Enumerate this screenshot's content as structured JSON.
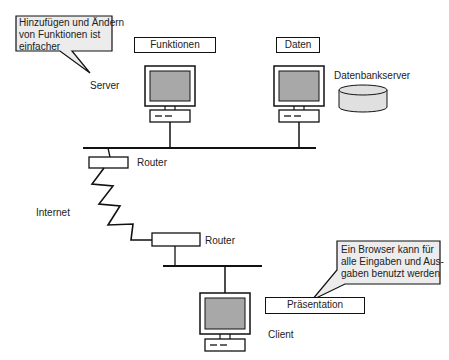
{
  "diagram": {
    "callouts": [
      {
        "id": "server-note",
        "text": "Hinzufügen und Ändern von Funktionen ist einfacher",
        "lines": [
          "Hinzufügen und Ändern",
          "von Funktionen ist",
          "einfacher"
        ]
      },
      {
        "id": "client-note",
        "text": "Ein Browser kann für alle Eingaben und Ausgaben benutzt werden",
        "lines": [
          "Ein Browser kann für",
          "alle Eingaben und Aus-",
          "gaben benutzt werden"
        ]
      }
    ],
    "boxes": {
      "functions": "Funktionen",
      "data": "Daten",
      "presentation": "Präsentation"
    },
    "labels": {
      "server": "Server",
      "db_server": "Datenbankserver",
      "router_top": "Router",
      "internet": "Internet",
      "router_bottom": "Router",
      "client": "Client"
    },
    "colors": {
      "callout_fill": "#ececec",
      "screen_fill": "#a8a8a8",
      "db_fill": "#e0e0e0",
      "line": "#111111"
    }
  }
}
